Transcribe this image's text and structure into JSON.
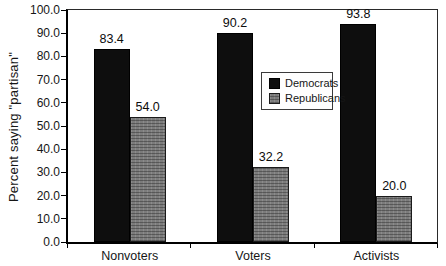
{
  "chart_data": {
    "type": "bar",
    "title": "",
    "xlabel": "",
    "ylabel": "Percent saying \"partisan\"",
    "categories": [
      "Nonvoters",
      "Voters",
      "Activists"
    ],
    "series": [
      {
        "name": "Democrats",
        "color": "#0e0e0e",
        "values": [
          83.4,
          90.2,
          93.8
        ],
        "value_labels": [
          "83.4",
          "90.2",
          "93.8"
        ]
      },
      {
        "name": "Republicans",
        "color": "#7c7c7c",
        "values": [
          54.0,
          32.2,
          20.0
        ],
        "value_labels": [
          "54.0",
          "32.2",
          "20.0"
        ]
      }
    ],
    "ylim": [
      0,
      100
    ],
    "ytick_step": 10,
    "ytick_labels": [
      "100.0",
      "90.0",
      "80.0",
      "70.0",
      "60.0",
      "50.0",
      "40.0",
      "30.0",
      "20.0",
      "10.0",
      "0.0"
    ],
    "grid": false,
    "legend_position": "center-inside"
  }
}
